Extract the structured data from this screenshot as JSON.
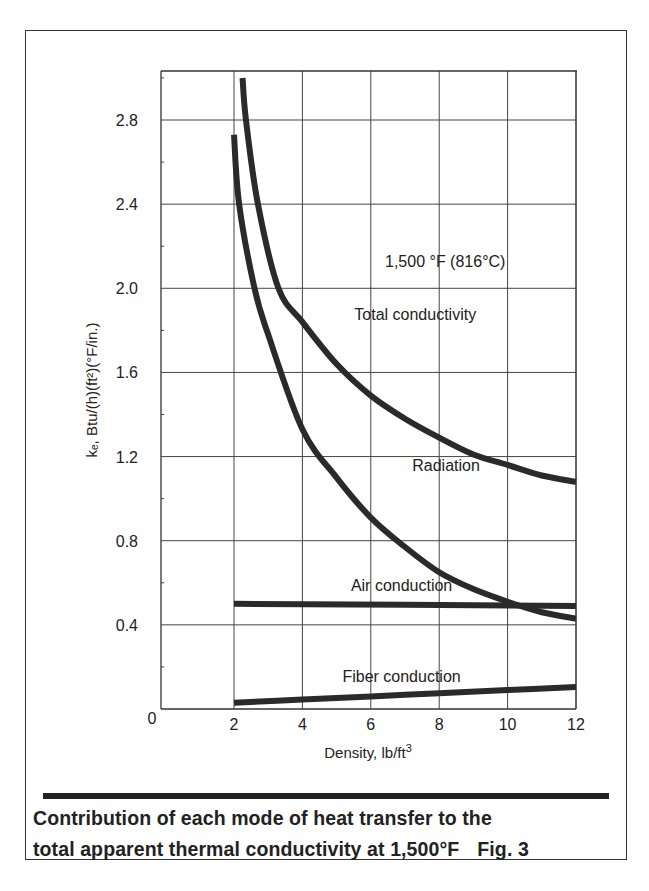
{
  "chart_data": {
    "type": "line",
    "title": "",
    "annotation": "1,500 °F (816°C)",
    "xlabel": "Density, lb/ft³",
    "ylabel": "kₑ, Btu/(h)(ft²)(°F/in.)",
    "xlim": [
      0,
      12
    ],
    "ylim": [
      0,
      3.0
    ],
    "x_ticks": [
      2,
      4,
      6,
      8,
      10,
      12
    ],
    "x_tick_labels": [
      "2",
      "4",
      "6",
      "8",
      "10",
      "12"
    ],
    "y_ticks": [
      0,
      0.4,
      0.8,
      1.2,
      1.6,
      2.0,
      2.4,
      2.8
    ],
    "y_tick_labels": [
      "0",
      "0.4",
      "0.8",
      "1.2",
      "1.6",
      "2.0",
      "2.4",
      "2.8"
    ],
    "grid": true,
    "legend": "inline labels",
    "series": [
      {
        "name": "Total conductivity",
        "x": [
          2.25,
          2.35,
          2.7,
          3.3,
          4,
          5,
          6,
          7,
          8,
          9,
          10,
          11,
          12
        ],
        "values": [
          3.0,
          2.8,
          2.4,
          2.0,
          1.84,
          1.64,
          1.49,
          1.38,
          1.29,
          1.21,
          1.16,
          1.11,
          1.08
        ],
        "label_pos": [
          7.3,
          1.85
        ]
      },
      {
        "name": "Radiation",
        "x": [
          2.0,
          2.15,
          2.6,
          3.0,
          4,
          5,
          6,
          7,
          8,
          9,
          10,
          11,
          12
        ],
        "values": [
          2.73,
          2.4,
          2.0,
          1.78,
          1.33,
          1.1,
          0.91,
          0.77,
          0.65,
          0.57,
          0.51,
          0.46,
          0.43
        ],
        "label_pos": [
          8.2,
          1.13
        ]
      },
      {
        "name": "Air conduction",
        "x": [
          2,
          12
        ],
        "values": [
          0.5,
          0.49
        ],
        "label_pos": [
          6.9,
          0.56
        ]
      },
      {
        "name": "Fiber conduction",
        "x": [
          2,
          4,
          6,
          8,
          10,
          12
        ],
        "values": [
          0.03,
          0.045,
          0.06,
          0.075,
          0.09,
          0.105
        ],
        "label_pos": [
          6.9,
          0.13
        ]
      }
    ]
  },
  "caption": {
    "line1": "Contribution of each mode of heat transfer to the",
    "line2": "total apparent thermal conductivity at 1,500°F",
    "figure_label": "Fig. 3"
  },
  "colors": {
    "curve": "#2a2a2a",
    "grid": "#555555",
    "text": "#222222"
  }
}
